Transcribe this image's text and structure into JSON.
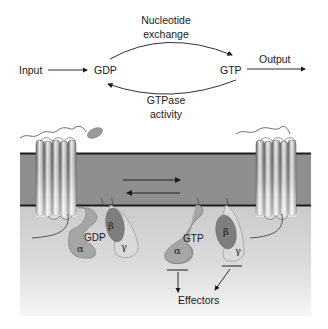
{
  "cycle": {
    "input": "Input",
    "gdp": "GDP",
    "gtp": "GTP",
    "output": "Output",
    "exchange_line1": "Nucleotide",
    "exchange_line2": "exchange",
    "gtpase_line1": "GTPase",
    "gtpase_line2": "activity"
  },
  "membrane": {
    "inactive_complex": {
      "nucleotide": "GDP",
      "alpha": "α",
      "beta": "β",
      "gamma": "γ"
    },
    "active_alpha": {
      "nucleotide": "GTP",
      "alpha": "α"
    },
    "active_beta_gamma": {
      "beta": "β",
      "gamma": "γ"
    },
    "effectors": "Effectors"
  },
  "colors": {
    "membrane": "#8c8c8c",
    "membrane_edge": "#1e1e1e",
    "cytoplasm_top": "#cfcfcf",
    "cytoplasm_bottom": "#f4f4f4",
    "alpha_fill": "#a9a9a9",
    "beta_fill": "#7d7d7d",
    "gamma_fill": "#d9d9d9"
  }
}
